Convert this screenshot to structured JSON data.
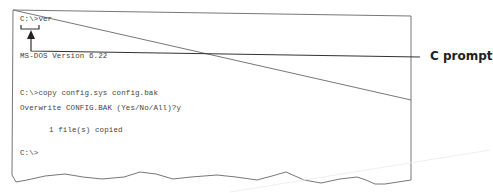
{
  "terminal": {
    "lines": [
      {
        "text": "C:\\>ver",
        "x": 20,
        "y": 21
      },
      {
        "text": "MS-DOS Version 6.22",
        "x": 20,
        "y": 58
      },
      {
        "text": "C:\\>copy config.sys config.bak",
        "x": 20,
        "y": 95
      },
      {
        "text": "Overwrite CONFIG.BAK (Yes/No/All)?y",
        "x": 20,
        "y": 110
      },
      {
        "text": "1 file(s) copied",
        "x": 49,
        "y": 132
      },
      {
        "text": "C:\\>",
        "x": 20,
        "y": 155
      }
    ]
  },
  "callout": {
    "label": "C prompt"
  },
  "colors": {
    "border": "#777777",
    "leader": "#333333",
    "text": "#444444"
  }
}
